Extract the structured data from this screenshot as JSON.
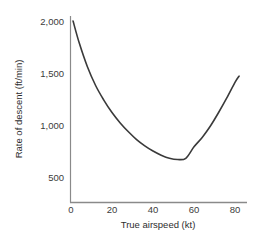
{
  "chart_data": {
    "type": "line",
    "title": "",
    "xlabel": "True airspeed (kt)",
    "ylabel": "Rate of descent (ft/min)",
    "xlim": [
      0,
      86
    ],
    "ylim": [
      380,
      2060
    ],
    "xticks": [
      0,
      20,
      40,
      60,
      80
    ],
    "xticklabels": [
      "0",
      "20",
      "40",
      "60",
      "80"
    ],
    "yticks": [
      500,
      1000,
      1500,
      2000
    ],
    "yticklabels": [
      "500",
      "1,000",
      "1,500",
      "2,000"
    ],
    "grid": false,
    "legend": null,
    "series": [
      {
        "name": "Rate of descent",
        "color": "#3a3a3a",
        "linewidth": 1.6,
        "x": [
          1,
          4,
          8,
          12,
          16,
          20,
          24,
          28,
          32,
          36,
          40,
          44,
          48,
          52,
          56,
          60,
          64,
          68,
          72,
          76,
          80,
          82
        ],
        "y": [
          2000,
          1790,
          1560,
          1380,
          1240,
          1120,
          1020,
          935,
          860,
          800,
          750,
          710,
          680,
          668,
          680,
          790,
          880,
          990,
          1120,
          1260,
          1410,
          1470
        ]
      }
    ],
    "minimum": {
      "x": 50,
      "y": 665
    }
  },
  "axis_labels": {
    "x_title": "True airspeed (kt)",
    "y_title": "Rate of descent (ft/min)"
  },
  "colors": {
    "line": "#3a3a3a",
    "axis": "#8a8a8a",
    "text": "#333333",
    "background": "#ffffff"
  }
}
